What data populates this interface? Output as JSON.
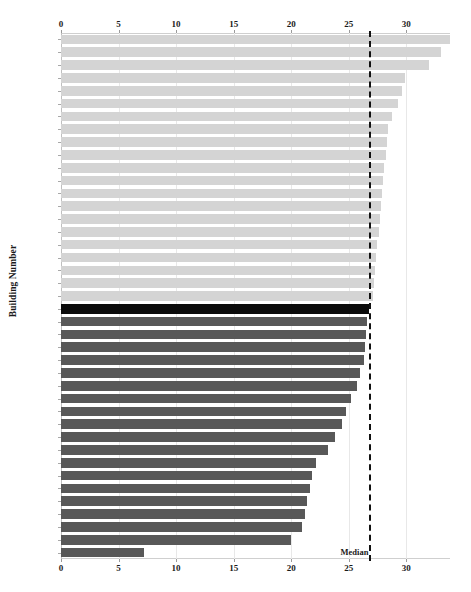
{
  "chart_data": {
    "type": "bar",
    "orientation": "horizontal",
    "title": "",
    "xlabel": "",
    "ylabel": "Building Number",
    "xlim": [
      0,
      33.8
    ],
    "xticks": [
      0,
      5,
      10,
      15,
      20,
      25,
      30
    ],
    "xtick_labels": [
      "0",
      "5",
      "10",
      "15",
      "20",
      "25",
      "30"
    ],
    "grid": true,
    "grid_axis": "x",
    "axis_top_labels": true,
    "axis_bottom_labels": true,
    "legend": null,
    "annotations": [
      {
        "name": "median-line",
        "label": "Median",
        "value": 26.8,
        "style": "dashed-vertical-black"
      }
    ],
    "colors": {
      "above_median": "#d4d4d4",
      "below_median": "#585858",
      "median_row": "#0b0b0b",
      "gridline": "#e8e8e8",
      "axis": "#bfbfbf",
      "text": "#111111"
    },
    "categories": [
      "6057",
      "2551",
      "4551",
      "1522",
      "657",
      "5631",
      "4661",
      "857",
      "1512",
      "4412",
      "9441",
      "1702",
      "6661",
      "6631",
      "7661",
      "6401",
      "6412",
      "3661",
      "4432",
      "4522",
      "7401",
      "Median",
      "4401",
      "4702",
      "4512",
      "3401",
      "6432",
      "4631",
      "5001",
      "5661",
      "2847",
      "7631",
      "4502",
      "9549",
      "1",
      "847",
      "3631",
      "9449",
      "9649",
      "1502",
      "432"
    ],
    "values": [
      33.8,
      33.0,
      32.0,
      29.9,
      29.6,
      29.3,
      28.8,
      28.4,
      28.3,
      28.2,
      28.1,
      28.0,
      27.9,
      27.8,
      27.7,
      27.6,
      27.5,
      27.4,
      27.3,
      27.2,
      27.1,
      26.8,
      26.6,
      26.5,
      26.4,
      26.3,
      26.0,
      25.7,
      25.2,
      24.8,
      24.4,
      23.8,
      23.2,
      22.2,
      21.8,
      21.6,
      21.4,
      21.2,
      20.9,
      20.0,
      7.2
    ],
    "series_groups": [
      {
        "name": "above-median",
        "start_index": 0,
        "end_index": 20,
        "color": "#d4d4d4"
      },
      {
        "name": "median",
        "start_index": 21,
        "end_index": 21,
        "color": "#0b0b0b"
      },
      {
        "name": "below-median",
        "start_index": 22,
        "end_index": 40,
        "color": "#585858"
      }
    ]
  }
}
